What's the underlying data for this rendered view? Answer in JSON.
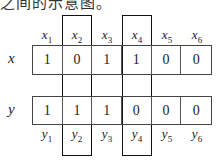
{
  "caption": "之间的示意图。",
  "rows": [
    {
      "label": "x",
      "values": [
        "1",
        "0",
        "1",
        "1",
        "0",
        "0"
      ],
      "headers": [
        {
          "v": "x",
          "s": "1"
        },
        {
          "v": "x",
          "s": "2"
        },
        {
          "v": "x",
          "s": "3"
        },
        {
          "v": "x",
          "s": "4"
        },
        {
          "v": "x",
          "s": "5"
        },
        {
          "v": "x",
          "s": "6"
        }
      ]
    },
    {
      "label": "y",
      "values": [
        "1",
        "1",
        "1",
        "0",
        "0",
        "0"
      ],
      "headers": [
        {
          "v": "y",
          "s": "1"
        },
        {
          "v": "y",
          "s": "2"
        },
        {
          "v": "y",
          "s": "3"
        },
        {
          "v": "y",
          "s": "4"
        },
        {
          "v": "y",
          "s": "5"
        },
        {
          "v": "y",
          "s": "6"
        }
      ]
    }
  ],
  "highlighted_columns": [
    2,
    4
  ]
}
